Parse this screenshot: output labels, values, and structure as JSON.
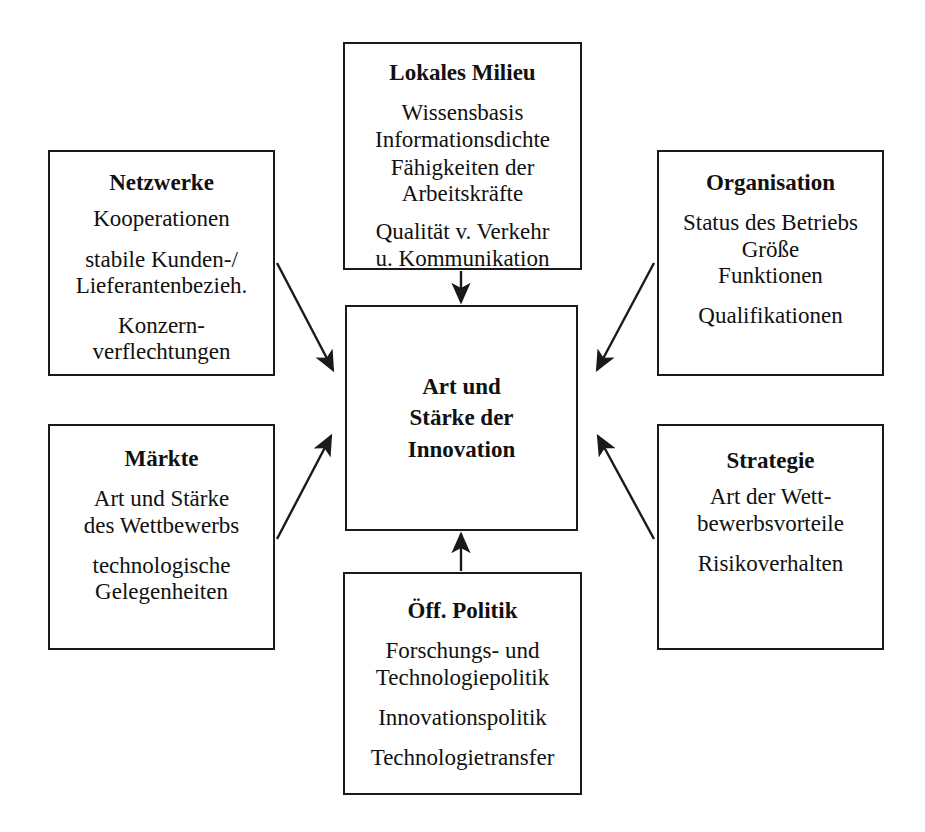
{
  "diagram": {
    "center": {
      "title": "Art und\nStärke der\nInnovation"
    },
    "top": {
      "title": "Lokales Milieu",
      "group1": "Wissensbasis\nInformationsdichte",
      "group2": "Fähigkeiten der\nArbeitskräfte",
      "group3": "Qualität v. Verkehr\nu. Kommunikation"
    },
    "top_left": {
      "title": "Netzwerke",
      "group1": "Kooperationen",
      "group2": "stabile Kunden-/\nLieferantenbezieh.",
      "group3": "Konzern-\nverflechtungen"
    },
    "top_right": {
      "title": "Organisation",
      "group1": "Status des Betriebs\nGröße\nFunktionen",
      "group2": "Qualifikationen"
    },
    "bottom_left": {
      "title": "Märkte",
      "group1": "Art und Stärke\ndes Wettbewerbs",
      "group2": "technologische\nGelegenheiten"
    },
    "bottom_right": {
      "title": "Strategie",
      "group1": "Art der Wett-\nbewerbsvorteile",
      "group2": "Risikoverhalten"
    },
    "bottom": {
      "title": "Öff. Politik",
      "group1": "Forschungs- und\nTechnologiepolitik",
      "group2": "Innovationspolitik",
      "group3": "Technologietransfer"
    },
    "colors": {
      "stroke": "#1a1a1a",
      "background": "#ffffff",
      "text": "#111111"
    },
    "arrows": [
      {
        "name": "arrow-netzwerke-to-center",
        "from": [
          277,
          263
        ],
        "to": [
          333,
          370
        ]
      },
      {
        "name": "arrow-maerkte-to-center",
        "from": [
          277,
          539
        ],
        "to": [
          331,
          436
        ]
      },
      {
        "name": "arrow-organisation-to-center",
        "from": [
          654,
          263
        ],
        "to": [
          597,
          370
        ]
      },
      {
        "name": "arrow-strategie-to-center",
        "from": [
          654,
          539
        ],
        "to": [
          598,
          436
        ]
      },
      {
        "name": "arrow-lokales-milieu-to-center",
        "from": [
          461,
          271
        ],
        "to": [
          461,
          302
        ]
      },
      {
        "name": "arrow-oeff-politik-to-center",
        "from": [
          461,
          571
        ],
        "to": [
          461,
          534
        ]
      }
    ]
  }
}
